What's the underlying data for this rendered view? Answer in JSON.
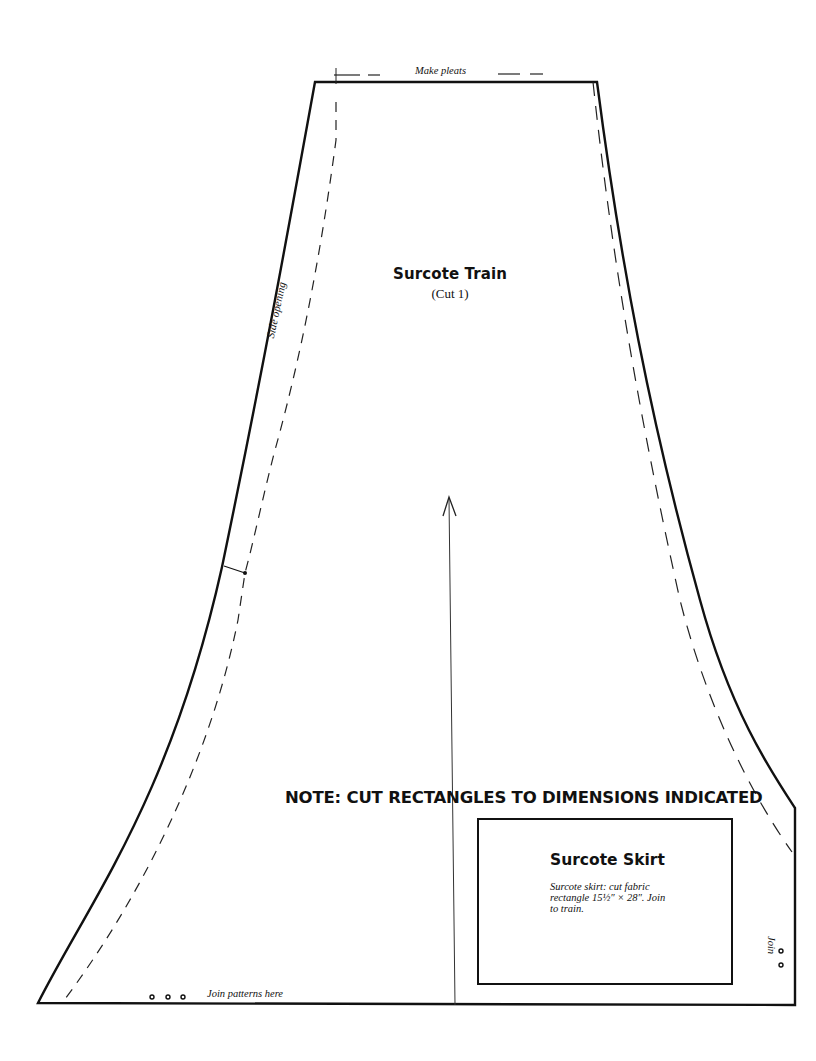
{
  "document": {
    "type": "sewing-pattern",
    "piece": {
      "title": "Surcote Train",
      "cut": "(Cut 1)"
    },
    "labels": {
      "make_pleats": "Make pleats",
      "side_opening": "Side opening",
      "join_patterns_here": "Join patterns here",
      "join": "Join"
    },
    "note": "NOTE: CUT RECTANGLES TO DIMENSIONS INDICATED",
    "skirt": {
      "title": "Surcote Skirt",
      "description": "Surcote skirt: cut fabric rectangle 15½″ × 28″. Join to train."
    },
    "markers": {
      "bottom_join_dots": 3,
      "right_join_dots": 2
    },
    "grainline_arrow": "up",
    "colors": {
      "line": "#111111",
      "paper": "#ffffff"
    }
  }
}
